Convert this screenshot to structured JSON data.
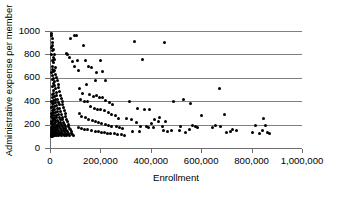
{
  "chart_data": {
    "type": "scatter",
    "title": "",
    "xlabel": "Enrollment",
    "ylabel": "Administrative expense per member",
    "xlim": [
      0,
      1000000
    ],
    "ylim": [
      0,
      1000
    ],
    "xticks": [
      0,
      200000,
      400000,
      600000,
      800000,
      1000000
    ],
    "xtick_labels": [
      "0",
      "200,000",
      "400,000",
      "600,000",
      "800,000",
      "1,000,000"
    ],
    "yticks": [
      0,
      200,
      400,
      600,
      800,
      1000
    ],
    "ytick_labels": [
      "0",
      "200",
      "400",
      "600",
      "800",
      "1000"
    ],
    "grid": "horizontal",
    "legend": null,
    "marker": {
      "shape": "diamond",
      "color": "#000000",
      "size": 3
    },
    "colors": {
      "marker": "#000000",
      "gridline": "#808080",
      "axis": "#6d6d6d",
      "background": "#ffffff"
    },
    "points": [
      [
        2000,
        980
      ],
      [
        3500,
        965
      ],
      [
        5000,
        940
      ],
      [
        4000,
        905
      ],
      [
        6500,
        880
      ],
      [
        3000,
        860
      ],
      [
        8000,
        845
      ],
      [
        5500,
        830
      ],
      [
        2500,
        800
      ],
      [
        12000,
        795
      ],
      [
        9000,
        770
      ],
      [
        14000,
        760
      ],
      [
        7000,
        745
      ],
      [
        11000,
        730
      ],
      [
        4500,
        700
      ],
      [
        16000,
        690
      ],
      [
        6000,
        675
      ],
      [
        13000,
        660
      ],
      [
        9500,
        650
      ],
      [
        3800,
        645
      ],
      [
        18000,
        630
      ],
      [
        7500,
        620
      ],
      [
        21000,
        605
      ],
      [
        10500,
        595
      ],
      [
        5200,
        585
      ],
      [
        24000,
        575
      ],
      [
        15000,
        565
      ],
      [
        8500,
        555
      ],
      [
        28000,
        545
      ],
      [
        12500,
        535
      ],
      [
        6800,
        525
      ],
      [
        31000,
        515
      ],
      [
        17000,
        505
      ],
      [
        9200,
        495
      ],
      [
        35000,
        485
      ],
      [
        20000,
        475
      ],
      [
        11500,
        465
      ],
      [
        4200,
        460
      ],
      [
        38000,
        450
      ],
      [
        23000,
        445
      ],
      [
        14500,
        438
      ],
      [
        7200,
        430
      ],
      [
        41000,
        425
      ],
      [
        26000,
        418
      ],
      [
        16500,
        412
      ],
      [
        9800,
        405
      ],
      [
        2800,
        400
      ],
      [
        44000,
        398
      ],
      [
        29000,
        392
      ],
      [
        19000,
        388
      ],
      [
        11000,
        382
      ],
      [
        5800,
        378
      ],
      [
        47000,
        372
      ],
      [
        32000,
        368
      ],
      [
        21500,
        362
      ],
      [
        13000,
        358
      ],
      [
        7800,
        352
      ],
      [
        3200,
        348
      ],
      [
        50000,
        345
      ],
      [
        35000,
        340
      ],
      [
        24500,
        338
      ],
      [
        15500,
        332
      ],
      [
        9000,
        328
      ],
      [
        4800,
        322
      ],
      [
        53000,
        318
      ],
      [
        38000,
        315
      ],
      [
        27000,
        310
      ],
      [
        18000,
        306
      ],
      [
        10800,
        302
      ],
      [
        6200,
        298
      ],
      [
        2400,
        295
      ],
      [
        56000,
        292
      ],
      [
        41000,
        288
      ],
      [
        30000,
        285
      ],
      [
        20500,
        282
      ],
      [
        12800,
        278
      ],
      [
        7400,
        275
      ],
      [
        3600,
        272
      ],
      [
        59000,
        268
      ],
      [
        44000,
        265
      ],
      [
        33000,
        262
      ],
      [
        23000,
        258
      ],
      [
        14800,
        255
      ],
      [
        8800,
        252
      ],
      [
        4400,
        248
      ],
      [
        62000,
        246
      ],
      [
        47000,
        242
      ],
      [
        36000,
        240
      ],
      [
        25500,
        238
      ],
      [
        17000,
        235
      ],
      [
        10200,
        232
      ],
      [
        5400,
        228
      ],
      [
        2200,
        226
      ],
      [
        65000,
        224
      ],
      [
        50000,
        222
      ],
      [
        39000,
        219
      ],
      [
        28000,
        216
      ],
      [
        19500,
        214
      ],
      [
        12200,
        212
      ],
      [
        6600,
        209
      ],
      [
        3000,
        206
      ],
      [
        68000,
        204
      ],
      [
        53000,
        202
      ],
      [
        42000,
        200
      ],
      [
        31000,
        198
      ],
      [
        22000,
        196
      ],
      [
        14200,
        194
      ],
      [
        8200,
        192
      ],
      [
        4000,
        190
      ],
      [
        71000,
        188
      ],
      [
        56000,
        186
      ],
      [
        45000,
        184
      ],
      [
        34000,
        182
      ],
      [
        24000,
        180
      ],
      [
        16200,
        178
      ],
      [
        9600,
        176
      ],
      [
        5000,
        174
      ],
      [
        2000,
        172
      ],
      [
        74000,
        170
      ],
      [
        59000,
        169
      ],
      [
        48000,
        167
      ],
      [
        37000,
        165
      ],
      [
        26500,
        163
      ],
      [
        18200,
        162
      ],
      [
        11200,
        160
      ],
      [
        6000,
        158
      ],
      [
        2600,
        156
      ],
      [
        77000,
        155
      ],
      [
        62000,
        153
      ],
      [
        51000,
        152
      ],
      [
        40000,
        150
      ],
      [
        29500,
        148
      ],
      [
        20200,
        147
      ],
      [
        13200,
        145
      ],
      [
        7200,
        143
      ],
      [
        3400,
        142
      ],
      [
        80000,
        140
      ],
      [
        65000,
        139
      ],
      [
        54000,
        138
      ],
      [
        43000,
        136
      ],
      [
        32500,
        135
      ],
      [
        22500,
        133
      ],
      [
        15200,
        132
      ],
      [
        8600,
        130
      ],
      [
        4200,
        129
      ],
      [
        1800,
        128
      ],
      [
        83000,
        127
      ],
      [
        68000,
        126
      ],
      [
        57000,
        125
      ],
      [
        46000,
        124
      ],
      [
        35500,
        123
      ],
      [
        25000,
        122
      ],
      [
        17200,
        121
      ],
      [
        10000,
        120
      ],
      [
        5200,
        119
      ],
      [
        2400,
        118
      ],
      [
        86000,
        117
      ],
      [
        71000,
        116
      ],
      [
        60000,
        115
      ],
      [
        49000,
        114
      ],
      [
        38500,
        114
      ],
      [
        28000,
        113
      ],
      [
        19200,
        112
      ],
      [
        12000,
        111
      ],
      [
        6400,
        110
      ],
      [
        3000,
        110
      ],
      [
        90000,
        108
      ],
      [
        75000,
        107
      ],
      [
        63000,
        106
      ],
      [
        52000,
        106
      ],
      [
        41500,
        105
      ],
      [
        31000,
        104
      ],
      [
        21200,
        104
      ],
      [
        14000,
        103
      ],
      [
        7600,
        102
      ],
      [
        3800,
        102
      ],
      [
        95000,
        960
      ],
      [
        78000,
        935
      ],
      [
        66000,
        800
      ],
      [
        62000,
        805
      ],
      [
        100000,
        965
      ],
      [
        72000,
        770
      ],
      [
        85000,
        740
      ],
      [
        92000,
        700
      ],
      [
        105000,
        745
      ],
      [
        110000,
        660
      ],
      [
        128000,
        875
      ],
      [
        135000,
        745
      ],
      [
        148000,
        700
      ],
      [
        160000,
        690
      ],
      [
        175000,
        575
      ],
      [
        182000,
        645
      ],
      [
        195000,
        745
      ],
      [
        205000,
        650
      ],
      [
        215000,
        575
      ],
      [
        112000,
        510
      ],
      [
        125000,
        470
      ],
      [
        140000,
        540
      ],
      [
        152000,
        455
      ],
      [
        168000,
        440
      ],
      [
        180000,
        450
      ],
      [
        192000,
        430
      ],
      [
        205000,
        430
      ],
      [
        218000,
        410
      ],
      [
        232000,
        390
      ],
      [
        245000,
        375
      ],
      [
        118000,
        415
      ],
      [
        132000,
        400
      ],
      [
        145000,
        395
      ],
      [
        158000,
        355
      ],
      [
        172000,
        340
      ],
      [
        186000,
        330
      ],
      [
        198000,
        325
      ],
      [
        212000,
        318
      ],
      [
        228000,
        300
      ],
      [
        240000,
        285
      ],
      [
        255000,
        275
      ],
      [
        268000,
        250
      ],
      [
        115000,
        295
      ],
      [
        122000,
        270
      ],
      [
        138000,
        258
      ],
      [
        150000,
        245
      ],
      [
        165000,
        235
      ],
      [
        178000,
        225
      ],
      [
        190000,
        215
      ],
      [
        202000,
        210
      ],
      [
        216000,
        200
      ],
      [
        230000,
        195
      ],
      [
        242000,
        188
      ],
      [
        258000,
        180
      ],
      [
        272000,
        175
      ],
      [
        285000,
        168
      ],
      [
        108000,
        175
      ],
      [
        120000,
        168
      ],
      [
        134000,
        162
      ],
      [
        146000,
        155
      ],
      [
        162000,
        150
      ],
      [
        176000,
        145
      ],
      [
        188000,
        140
      ],
      [
        200000,
        135
      ],
      [
        214000,
        130
      ],
      [
        226000,
        128
      ],
      [
        238000,
        125
      ],
      [
        252000,
        120
      ],
      [
        265000,
        115
      ],
      [
        278000,
        112
      ],
      [
        292000,
        110
      ],
      [
        330000,
        910
      ],
      [
        452000,
        898
      ],
      [
        362000,
        755
      ],
      [
        310000,
        395
      ],
      [
        345000,
        335
      ],
      [
        372000,
        330
      ],
      [
        392000,
        325
      ],
      [
        300000,
        255
      ],
      [
        318000,
        245
      ],
      [
        338000,
        215
      ],
      [
        355000,
        185
      ],
      [
        378000,
        180
      ],
      [
        398000,
        212
      ],
      [
        412000,
        245
      ],
      [
        428000,
        225
      ],
      [
        442000,
        180
      ],
      [
        448000,
        150
      ],
      [
        462000,
        145
      ],
      [
        478000,
        150
      ],
      [
        322000,
        145
      ],
      [
        352000,
        140
      ],
      [
        385000,
        172
      ],
      [
        405000,
        175
      ],
      [
        432000,
        265
      ],
      [
        455000,
        230
      ],
      [
        488000,
        398
      ],
      [
        525000,
        412
      ],
      [
        552000,
        380
      ],
      [
        512000,
        188
      ],
      [
        535000,
        135
      ],
      [
        560000,
        190
      ],
      [
        582000,
        175
      ],
      [
        598000,
        275
      ],
      [
        508000,
        148
      ],
      [
        548000,
        155
      ],
      [
        572000,
        185
      ],
      [
        668000,
        510
      ],
      [
        688000,
        290
      ],
      [
        652000,
        190
      ],
      [
        672000,
        180
      ],
      [
        698000,
        135
      ],
      [
        712000,
        145
      ],
      [
        722000,
        155
      ],
      [
        735000,
        150
      ],
      [
        642000,
        175
      ],
      [
        798000,
        132
      ],
      [
        812000,
        195
      ],
      [
        828000,
        125
      ],
      [
        842000,
        255
      ],
      [
        852000,
        190
      ],
      [
        866000,
        120
      ],
      [
        838000,
        148
      ],
      [
        858000,
        135
      ]
    ]
  }
}
